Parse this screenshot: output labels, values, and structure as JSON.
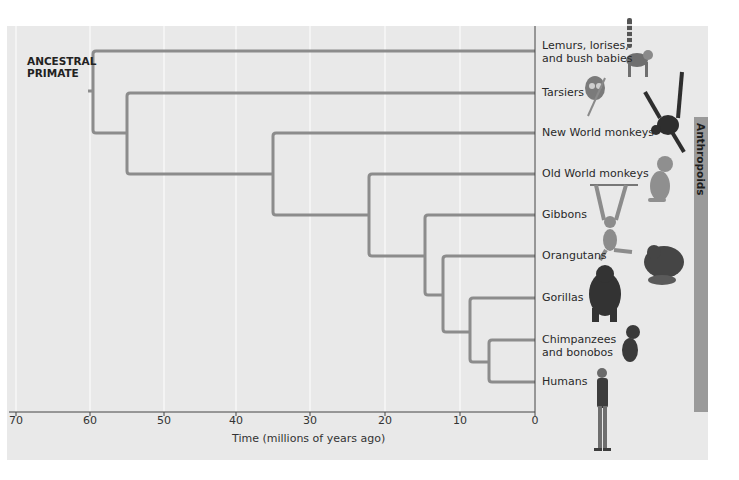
{
  "diagram": {
    "type": "phylogenetic-tree",
    "root_label": [
      "ANCESTRAL",
      "PRIMATE"
    ],
    "taxa": [
      {
        "label": [
          "Lemurs, lorises,",
          "and bush babies"
        ],
        "y": 51
      },
      {
        "label": [
          "Tarsiers"
        ],
        "y": 93
      },
      {
        "label": [
          "New World monkeys"
        ],
        "y": 133
      },
      {
        "label": [
          "Old World monkeys"
        ],
        "y": 174
      },
      {
        "label": [
          "Gibbons"
        ],
        "y": 215
      },
      {
        "label": [
          "Orangutans"
        ],
        "y": 256
      },
      {
        "label": [
          "Gorillas"
        ],
        "y": 298
      },
      {
        "label": [
          "Chimpanzees",
          "and bonobos"
        ],
        "y": 340
      },
      {
        "label": [
          "Humans"
        ],
        "y": 382
      }
    ],
    "divergence_mya": [
      {
        "node": "primates",
        "mya": 59
      },
      {
        "node": "tarsiers+anthropoids",
        "mya": 55
      },
      {
        "node": "anthropoids",
        "mya": 35
      },
      {
        "node": "catarrhines",
        "mya": 22
      },
      {
        "node": "apes",
        "mya": 15
      },
      {
        "node": "great-apes",
        "mya": 12.5
      },
      {
        "node": "african-apes",
        "mya": 9
      },
      {
        "node": "chimp-human",
        "mya": 6
      }
    ],
    "bracket_label": "Anthropoids",
    "x_axis": {
      "label": "Time (millions of years ago)",
      "ticks": [
        "70",
        "60",
        "50",
        "40",
        "30",
        "20",
        "10",
        "0"
      ]
    },
    "illustrations": [
      "ring-tailed-lemur",
      "tarsier",
      "spider-monkey",
      "old-world-monkey",
      "gibbon",
      "orangutan",
      "gorilla",
      "chimpanzee",
      "human"
    ],
    "colors": {
      "background": "#e9e9e9",
      "branch": "#8c8c8c",
      "grid": "#ffffff",
      "bracket": "#9a9a9a"
    }
  }
}
